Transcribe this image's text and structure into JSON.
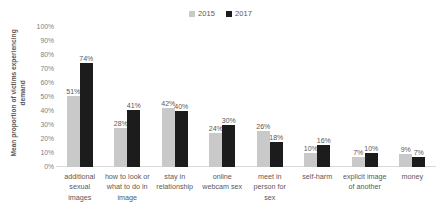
{
  "chart_data": {
    "type": "bar",
    "title": "",
    "subtitle": "",
    "xlabel": "",
    "ylabel": "Mean proportion of victims experiencing demand",
    "ylim": [
      0,
      100
    ],
    "ytick_labels": [
      "100%",
      "90%",
      "80%",
      "70%",
      "60%",
      "50%",
      "40%",
      "30%",
      "20%",
      "10%",
      "0%"
    ],
    "ytick_values": [
      100,
      90,
      80,
      70,
      60,
      50,
      40,
      30,
      20,
      10,
      0
    ],
    "grid": false,
    "legend_position": "top-center",
    "categories": [
      "additional sexual images",
      "how to look or what to do in image",
      "stay in relationship",
      "online webcam sex",
      "meet in person for sex",
      "self-harm",
      "explicit image of another",
      "money"
    ],
    "category_lines": [
      [
        "additional",
        "sexual",
        "images"
      ],
      [
        "how to look",
        "or what to",
        "do in image"
      ],
      [
        "stay in",
        "relationship"
      ],
      [
        "online",
        "webcam sex"
      ],
      [
        "meet in",
        "person for",
        "sex"
      ],
      [
        "self-harm"
      ],
      [
        "explicit",
        "image of",
        "another"
      ],
      [
        "money"
      ]
    ],
    "series": [
      {
        "name": "2015",
        "color": "#c9c9c9",
        "values": [
          51,
          28,
          42,
          24,
          26,
          10,
          7,
          9
        ],
        "labels": [
          "51%",
          "28%",
          "42%",
          "24%",
          "26%",
          "10%",
          "7%",
          "9%"
        ]
      },
      {
        "name": "2017",
        "color": "#1c1c1c",
        "values": [
          74,
          41,
          40,
          30,
          18,
          16,
          10,
          7
        ],
        "labels": [
          "74%",
          "41%",
          "40%",
          "30%",
          "18%",
          "16%",
          "10%",
          "7%"
        ]
      }
    ]
  },
  "legend": {
    "items": [
      {
        "label": "2015",
        "color": "#c9c9c9"
      },
      {
        "label": "2017",
        "color": "#1c1c1c"
      }
    ]
  },
  "axis": {
    "y_title": "Mean proportion of victims experiencing demand"
  }
}
